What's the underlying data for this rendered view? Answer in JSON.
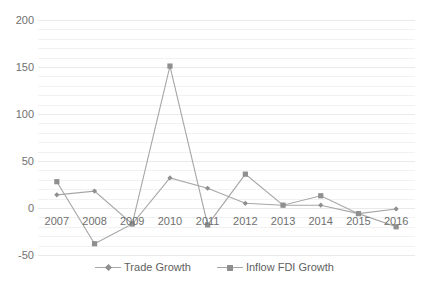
{
  "chart_data": {
    "type": "line",
    "title": "",
    "xlabel": "",
    "ylabel": "",
    "categories": [
      "2007",
      "2008",
      "2009",
      "2010",
      "2011",
      "2012",
      "2013",
      "2014",
      "2015",
      "2016"
    ],
    "ylim": [
      -50,
      200
    ],
    "ytick_values": [
      200,
      150,
      100,
      50,
      0,
      -50
    ],
    "ytick_labels": [
      "200",
      "150",
      "100",
      "50",
      "0",
      "-50"
    ],
    "minor_gridline_step": 10,
    "grid": true,
    "legend_position": "bottom",
    "series": [
      {
        "name": "Trade Growth",
        "marker": "diamond",
        "color": "#a6a6a6",
        "values": [
          14,
          18,
          -17,
          32,
          21,
          5,
          3,
          3,
          -6,
          -1
        ]
      },
      {
        "name": "Inflow FDI Growth",
        "marker": "square",
        "color": "#a6a6a6",
        "values": [
          28,
          -38,
          -17,
          151,
          -18,
          36,
          3,
          13,
          -6,
          -20
        ]
      }
    ]
  },
  "legend": {
    "entries": [
      {
        "label": "Trade Growth"
      },
      {
        "label": "Inflow FDI Growth"
      }
    ]
  },
  "colors": {
    "line": "#a6a6a6",
    "marker": "#8f8f8f",
    "gridline": "#f2f2f2",
    "gridline_major": "#eaeaea",
    "tick_text": "#6f6f6f",
    "background": "#ffffff"
  }
}
